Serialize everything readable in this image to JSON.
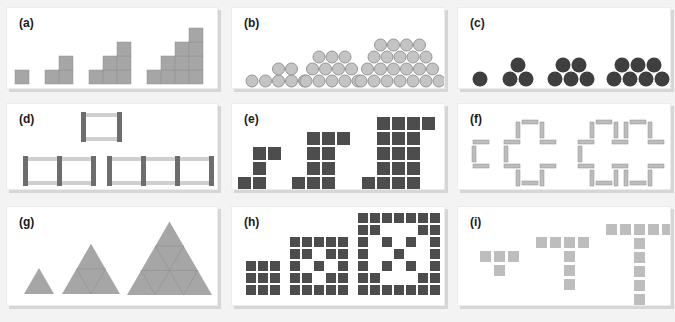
{
  "colors": {
    "background": "#f3f3f3",
    "panel": "#ffffff",
    "panel_shadow": "#d6d6d6",
    "gray_fill": "#a6a6a6",
    "gray_stroke": "#8f8f8f",
    "light_gray_fill": "#bdbdbd",
    "circle_light": "#c4c4c4",
    "circle_light_stroke": "#959595",
    "dark_fill": "#3f3f3f",
    "dark_rect": "#4d4d4d",
    "mid_bar": "#6d6d6d",
    "light_bar": "#cfcfcf"
  },
  "panels": [
    {
      "id": "a",
      "label": "(a)",
      "description": "Staircase of squares: 1, 3, 6, 10"
    },
    {
      "id": "b",
      "label": "(b)",
      "description": "Light circle trapezoids: 1, 2+4, 3+4+5, 4+5+6+7"
    },
    {
      "id": "c",
      "label": "(c)",
      "description": "Dark circle triangles: 1, 3, 5, 7"
    },
    {
      "id": "d",
      "label": "(d)",
      "description": "Toothpick rectangles: 1, 2, 3 cells"
    },
    {
      "id": "e",
      "label": "(e)",
      "description": "Dark square hooks growing"
    },
    {
      "id": "f",
      "label": "(f)",
      "description": "Toothpick cross outlines"
    },
    {
      "id": "g",
      "label": "(g)",
      "description": "Triangles subdivided: 1, 4, 9"
    },
    {
      "id": "h",
      "label": "(h)",
      "description": "Dark square lattice patterns 3x3, 5x5, 7x7"
    },
    {
      "id": "i",
      "label": "(i)",
      "description": "Light square T shapes: 3+1, 4+3, 5+5"
    }
  ],
  "figures": {
    "a": {
      "cell": 14,
      "groups": [
        {
          "x": 8,
          "cols": [
            1
          ]
        },
        {
          "x": 38,
          "cols": [
            1,
            2
          ]
        },
        {
          "x": 82,
          "cols": [
            1,
            2,
            3
          ]
        },
        {
          "x": 140,
          "cols": [
            1,
            2,
            3,
            4
          ]
        }
      ]
    },
    "b": {
      "r": 6.5,
      "groups": [
        {
          "cx": 20,
          "rows": [
            1
          ]
        },
        {
          "cx": 53,
          "rows": [
            4,
            2
          ]
        },
        {
          "cx": 100,
          "rows": [
            5,
            4,
            3
          ]
        },
        {
          "cx": 168,
          "rows": [
            7,
            6,
            5,
            4
          ]
        }
      ]
    },
    "c": {
      "r": 8,
      "groups": [
        {
          "cx": 22,
          "rows": [
            1
          ]
        },
        {
          "cx": 60,
          "rows": [
            2,
            1
          ]
        },
        {
          "cx": 113,
          "rows": [
            3,
            2
          ]
        },
        {
          "cx": 180,
          "rows": [
            4,
            3
          ]
        }
      ]
    },
    "e": {
      "cell": 13,
      "gap": 2,
      "shapes": [
        {
          "x": 6,
          "y": 73,
          "cells": [
            [
              0,
              2
            ],
            [
              1,
              2
            ],
            [
              1,
              1
            ],
            [
              1,
              0
            ],
            [
              2,
              0
            ]
          ]
        },
        {
          "x": 60,
          "y": 73,
          "cells": [
            [
              0,
              3
            ],
            [
              1,
              3
            ],
            [
              2,
              3
            ],
            [
              1,
              2
            ],
            [
              2,
              2
            ],
            [
              1,
              1
            ],
            [
              2,
              1
            ],
            [
              1,
              0
            ],
            [
              2,
              0
            ],
            [
              3,
              0
            ]
          ]
        },
        {
          "x": 130,
          "y": 73,
          "cells": [
            [
              0,
              4
            ],
            [
              1,
              4
            ],
            [
              2,
              4
            ],
            [
              3,
              4
            ],
            [
              1,
              3
            ],
            [
              2,
              3
            ],
            [
              3,
              3
            ],
            [
              1,
              2
            ],
            [
              2,
              2
            ],
            [
              3,
              2
            ],
            [
              1,
              1
            ],
            [
              2,
              1
            ],
            [
              3,
              1
            ],
            [
              1,
              0
            ],
            [
              2,
              0
            ],
            [
              3,
              0
            ],
            [
              4,
              0
            ]
          ]
        }
      ]
    },
    "h": {
      "cell": 10,
      "gap": 2,
      "grids": [
        {
          "x": 14,
          "size": 3,
          "pattern": [
            "111",
            "111",
            "111"
          ]
        },
        {
          "x": 58,
          "size": 5,
          "pattern": [
            "11111",
            "11011",
            "10101",
            "11011",
            "11111"
          ]
        },
        {
          "x": 126,
          "size": 7,
          "pattern": [
            "1111111",
            "1100011",
            "1010101",
            "1001001",
            "1010101",
            "1100011",
            "1111111"
          ]
        }
      ]
    },
    "i": {
      "cell": 11,
      "gap": 3,
      "shapes": [
        {
          "x": 22,
          "y": 44,
          "top": 3,
          "stem": 1
        },
        {
          "x": 78,
          "y": 30,
          "top": 4,
          "stem": 3
        },
        {
          "x": 148,
          "y": 17,
          "top": 5,
          "stem": 5
        }
      ]
    }
  }
}
